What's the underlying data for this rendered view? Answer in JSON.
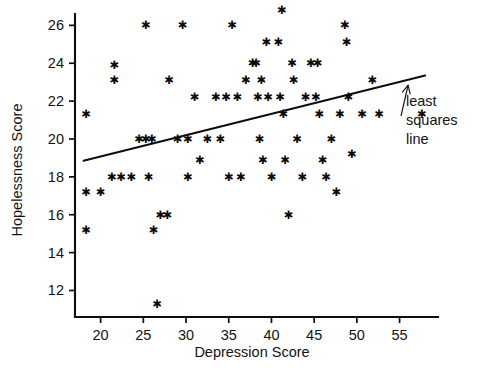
{
  "chart_data": {
    "type": "scatter",
    "title": "",
    "xlabel": "Depression Score",
    "ylabel": "Hopelessness Score",
    "xlim": [
      17.0,
      59.5
    ],
    "ylim": [
      10.6,
      26.6
    ],
    "xticks": [
      20,
      25,
      30,
      35,
      40,
      45,
      50,
      55
    ],
    "yticks": [
      12,
      14,
      16,
      18,
      20,
      22,
      24,
      26
    ],
    "xtick_labels": [
      "20",
      "25",
      "30",
      "35",
      "40",
      "45",
      "50",
      "55"
    ],
    "ytick_labels": [
      "12",
      "14",
      "16",
      "18",
      "20",
      "22",
      "24",
      "26"
    ],
    "grid": false,
    "legend": "none",
    "marker": "asterisk-star",
    "marker_color": "#0a0a0a",
    "points": [
      [
        18.3,
        21.3
      ],
      [
        18.3,
        17.2
      ],
      [
        18.3,
        15.2
      ],
      [
        20.0,
        17.2
      ],
      [
        21.3,
        18.0
      ],
      [
        21.6,
        23.9
      ],
      [
        21.6,
        23.1
      ],
      [
        22.4,
        18.0
      ],
      [
        23.6,
        18.0
      ],
      [
        24.5,
        20.0
      ],
      [
        25.3,
        20.0
      ],
      [
        25.3,
        26.0
      ],
      [
        25.6,
        18.0
      ],
      [
        26.0,
        20.0
      ],
      [
        26.2,
        15.2
      ],
      [
        26.6,
        11.3
      ],
      [
        27.0,
        16.0
      ],
      [
        27.8,
        16.0
      ],
      [
        28.0,
        23.1
      ],
      [
        29.0,
        20.0
      ],
      [
        29.6,
        26.0
      ],
      [
        30.2,
        20.0
      ],
      [
        30.2,
        18.0
      ],
      [
        31.0,
        22.2
      ],
      [
        31.6,
        18.9
      ],
      [
        32.5,
        20.0
      ],
      [
        33.5,
        22.2
      ],
      [
        34.0,
        20.0
      ],
      [
        34.7,
        22.2
      ],
      [
        35.0,
        18.0
      ],
      [
        35.4,
        26.0
      ],
      [
        36.0,
        22.2
      ],
      [
        36.4,
        18.0
      ],
      [
        37.0,
        23.1
      ],
      [
        37.8,
        24.0
      ],
      [
        38.2,
        24.0
      ],
      [
        38.4,
        22.2
      ],
      [
        38.6,
        20.0
      ],
      [
        38.8,
        23.1
      ],
      [
        39.0,
        18.9
      ],
      [
        39.4,
        25.1
      ],
      [
        39.6,
        22.2
      ],
      [
        40.0,
        18.0
      ],
      [
        40.8,
        25.1
      ],
      [
        41.0,
        22.2
      ],
      [
        41.2,
        26.8
      ],
      [
        41.4,
        21.3
      ],
      [
        41.6,
        18.9
      ],
      [
        42.0,
        16.0
      ],
      [
        42.4,
        24.0
      ],
      [
        42.6,
        23.1
      ],
      [
        43.0,
        20.0
      ],
      [
        43.6,
        18.0
      ],
      [
        44.0,
        22.2
      ],
      [
        44.6,
        24.0
      ],
      [
        45.2,
        22.2
      ],
      [
        45.4,
        24.0
      ],
      [
        45.6,
        21.3
      ],
      [
        46.0,
        18.9
      ],
      [
        46.4,
        18.0
      ],
      [
        47.0,
        20.0
      ],
      [
        47.6,
        17.2
      ],
      [
        48.0,
        21.3
      ],
      [
        48.6,
        26.0
      ],
      [
        48.8,
        25.1
      ],
      [
        49.0,
        22.2
      ],
      [
        49.4,
        19.2
      ],
      [
        50.6,
        21.3
      ],
      [
        51.8,
        23.1
      ],
      [
        52.6,
        21.3
      ],
      [
        57.6,
        21.3
      ]
    ],
    "fit_line": {
      "label": "least squares line",
      "x_start": 18.0,
      "y_start": 18.85,
      "x_end": 58.0,
      "y_end": 23.35,
      "slope": 0.1125,
      "intercept": 16.825
    },
    "annotation": {
      "lines": [
        "least",
        "squares",
        "line"
      ],
      "target_x": 56.0,
      "target_y": 23.0
    }
  },
  "axes": {
    "x_title": "Depression Score",
    "y_title": "Hopelessness Score"
  }
}
